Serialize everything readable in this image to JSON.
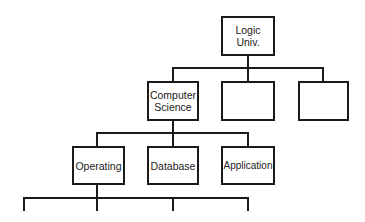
{
  "diagram": {
    "type": "hierarchy",
    "root": {
      "label": "Logic\nUniv."
    },
    "level2": [
      {
        "label": "Computer\nScience"
      },
      {
        "label": ""
      },
      {
        "label": ""
      }
    ],
    "level3": [
      {
        "label": "Operating"
      },
      {
        "label": "Database"
      },
      {
        "label": "Application"
      }
    ]
  }
}
